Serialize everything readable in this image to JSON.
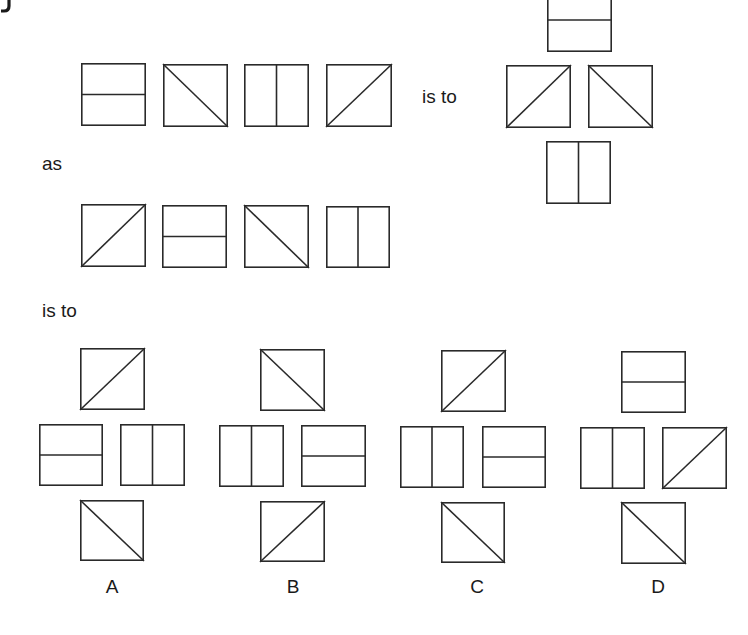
{
  "puzzle": {
    "corner_fragment": "J",
    "connectors": {
      "is_to_1": "is to",
      "as": "as",
      "is_to_2": "is to"
    },
    "stroke_color": "#2a2a2a",
    "row1": {
      "tiles": [
        {
          "x": 81,
          "y": 63,
          "w": 65,
          "h": 63,
          "pattern": "horizontal"
        },
        {
          "x": 163,
          "y": 64,
          "w": 65,
          "h": 63,
          "pattern": "backslash"
        },
        {
          "x": 244,
          "y": 64,
          "w": 65,
          "h": 63,
          "pattern": "vertical"
        },
        {
          "x": 326,
          "y": 64,
          "w": 66,
          "h": 63,
          "pattern": "slash"
        }
      ]
    },
    "row1_result": {
      "tiles": [
        {
          "x": 547,
          "y": -12,
          "w": 65,
          "h": 64,
          "pattern": "horizontal",
          "position": "top"
        },
        {
          "x": 506,
          "y": 65,
          "w": 65,
          "h": 63,
          "pattern": "slash",
          "position": "left"
        },
        {
          "x": 588,
          "y": 65,
          "w": 65,
          "h": 63,
          "pattern": "backslash",
          "position": "right"
        },
        {
          "x": 546,
          "y": 141,
          "w": 65,
          "h": 63,
          "pattern": "vertical",
          "position": "bottom"
        }
      ]
    },
    "row2": {
      "tiles": [
        {
          "x": 81,
          "y": 204,
          "w": 65,
          "h": 63,
          "pattern": "slash"
        },
        {
          "x": 162,
          "y": 205,
          "w": 65,
          "h": 63,
          "pattern": "horizontal"
        },
        {
          "x": 244,
          "y": 205,
          "w": 65,
          "h": 63,
          "pattern": "backslash"
        },
        {
          "x": 326,
          "y": 206,
          "w": 64,
          "h": 62,
          "pattern": "vertical"
        }
      ]
    },
    "options": [
      {
        "label": "A",
        "label_x": 112,
        "tiles": [
          {
            "x": 80,
            "y": 348,
            "w": 65,
            "h": 62,
            "pattern": "slash",
            "position": "top"
          },
          {
            "x": 39,
            "y": 424,
            "w": 64,
            "h": 62,
            "pattern": "horizontal",
            "position": "left"
          },
          {
            "x": 120,
            "y": 424,
            "w": 65,
            "h": 62,
            "pattern": "vertical",
            "position": "right"
          },
          {
            "x": 80,
            "y": 500,
            "w": 64,
            "h": 61,
            "pattern": "backslash",
            "position": "bottom"
          }
        ]
      },
      {
        "label": "B",
        "label_x": 293,
        "tiles": [
          {
            "x": 260,
            "y": 349,
            "w": 65,
            "h": 62,
            "pattern": "backslash",
            "position": "top"
          },
          {
            "x": 219,
            "y": 425,
            "w": 65,
            "h": 62,
            "pattern": "vertical",
            "position": "left"
          },
          {
            "x": 301,
            "y": 425,
            "w": 65,
            "h": 62,
            "pattern": "horizontal",
            "position": "right"
          },
          {
            "x": 260,
            "y": 501,
            "w": 65,
            "h": 61,
            "pattern": "slash",
            "position": "bottom"
          }
        ]
      },
      {
        "label": "C",
        "label_x": 477,
        "tiles": [
          {
            "x": 441,
            "y": 350,
            "w": 65,
            "h": 62,
            "pattern": "slash",
            "position": "top"
          },
          {
            "x": 400,
            "y": 426,
            "w": 64,
            "h": 62,
            "pattern": "vertical",
            "position": "left"
          },
          {
            "x": 482,
            "y": 426,
            "w": 64,
            "h": 62,
            "pattern": "horizontal",
            "position": "right"
          },
          {
            "x": 441,
            "y": 502,
            "w": 64,
            "h": 61,
            "pattern": "backslash",
            "position": "bottom"
          }
        ]
      },
      {
        "label": "D",
        "label_x": 658,
        "tiles": [
          {
            "x": 621,
            "y": 351,
            "w": 65,
            "h": 62,
            "pattern": "horizontal",
            "position": "top"
          },
          {
            "x": 580,
            "y": 427,
            "w": 65,
            "h": 62,
            "pattern": "vertical",
            "position": "left"
          },
          {
            "x": 662,
            "y": 427,
            "w": 65,
            "h": 62,
            "pattern": "slash",
            "position": "right"
          },
          {
            "x": 621,
            "y": 502,
            "w": 65,
            "h": 62,
            "pattern": "backslash",
            "position": "bottom"
          }
        ]
      }
    ]
  }
}
